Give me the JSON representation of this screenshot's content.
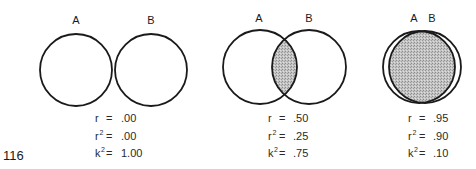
{
  "page_number": "116",
  "colors": {
    "stroke": "#1a1a1a",
    "overlap_fill": "#b8b8b8",
    "background": "#ffffff"
  },
  "panels": [
    {
      "labels": {
        "a": "A",
        "b": "B"
      },
      "circle_a": {
        "cx": 76,
        "cy": 70,
        "r": 36
      },
      "circle_b": {
        "cx": 151,
        "cy": 70,
        "r": 36
      },
      "overlap": "none",
      "stats": {
        "r": {
          "symbol": "r",
          "sup": "",
          "eq": "=",
          "value": ".00"
        },
        "r2": {
          "symbol": "r",
          "sup": "2",
          "eq": "=",
          "value": ".00"
        },
        "k2": {
          "symbol": "k",
          "sup": "2",
          "eq": "=",
          "value": "1.00"
        }
      }
    },
    {
      "labels": {
        "a": "A",
        "b": "B"
      },
      "circle_a": {
        "cx": 260,
        "cy": 67,
        "r": 37
      },
      "circle_b": {
        "cx": 309,
        "cy": 67,
        "r": 37
      },
      "overlap": "partial",
      "stats": {
        "r": {
          "symbol": "r",
          "sup": "",
          "eq": "=",
          "value": ".50"
        },
        "r2": {
          "symbol": "r",
          "sup": "2",
          "eq": "=",
          "value": ".25"
        },
        "k2": {
          "symbol": "k",
          "sup": "2",
          "eq": "=",
          "value": ".75"
        }
      }
    },
    {
      "labels": {
        "a": "A",
        "b": "B"
      },
      "circle_a": {
        "cx": 419,
        "cy": 67,
        "r": 36
      },
      "circle_b": {
        "cx": 425,
        "cy": 67,
        "r": 36
      },
      "overlap": "nearly-complete",
      "stats": {
        "r": {
          "symbol": "r",
          "sup": "",
          "eq": "=",
          "value": ".95"
        },
        "r2": {
          "symbol": "r",
          "sup": "2",
          "eq": "=",
          "value": ".90"
        },
        "k2": {
          "symbol": "k",
          "sup": "2",
          "eq": "=",
          "value": ".10"
        }
      }
    }
  ]
}
